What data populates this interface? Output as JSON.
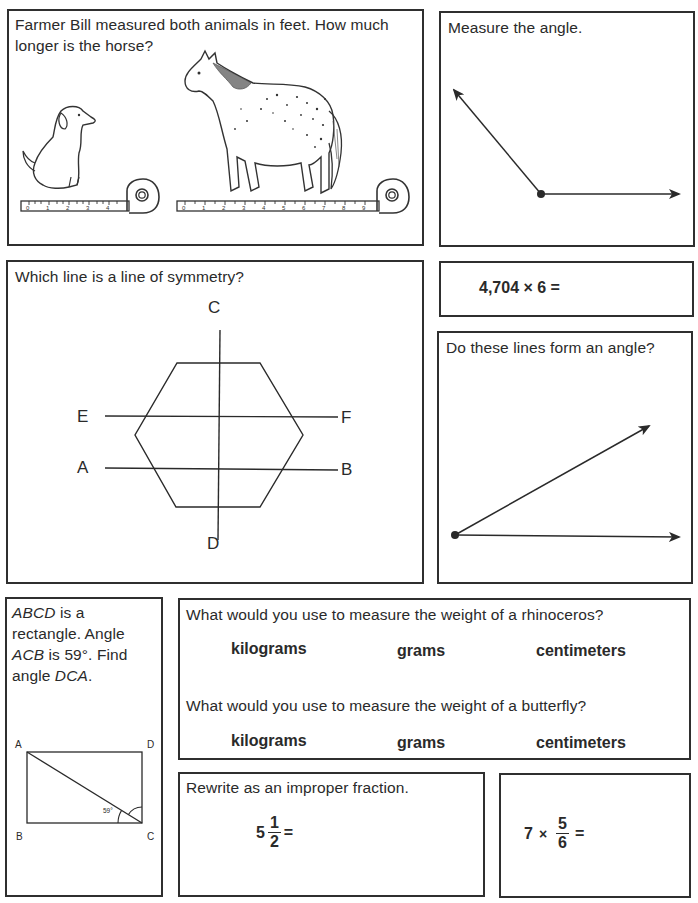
{
  "problems": {
    "horse": {
      "prompt": "Farmer Bill measured both animals in feet. How much longer is the horse?",
      "dog_tape_ticks": [
        "0",
        "1",
        "2",
        "3",
        "4"
      ],
      "horse_tape_ticks": [
        "0",
        "1",
        "2",
        "3",
        "4",
        "5",
        "6",
        "7",
        "8",
        "9"
      ]
    },
    "angle": {
      "prompt": "Measure the angle."
    },
    "symmetry": {
      "prompt": "Which line is a line of symmetry?",
      "labels": {
        "c": "C",
        "d": "D",
        "e": "E",
        "f": "F",
        "a": "A",
        "b": "B"
      }
    },
    "multiply": {
      "expression": "4,704 × 6 ="
    },
    "lines_angle": {
      "prompt": "Do these lines form an angle?"
    },
    "rectangle": {
      "prompt_parts": [
        "ABCD",
        " is a rectangle. Angle ",
        "ACB",
        " is 59°. Find angle ",
        "DCA",
        "."
      ],
      "labels": {
        "a": "A",
        "b": "B",
        "c": "C",
        "d": "D"
      },
      "angle_label": "59°"
    },
    "weight": {
      "q1": "What would you use to measure the weight of a rhinoceros?",
      "q2": "What would you use to measure the weight of a butterfly?",
      "options": [
        "kilograms",
        "grams",
        "centimeters"
      ]
    },
    "improper": {
      "prompt": "Rewrite as an improper fraction.",
      "whole": "5",
      "numerator": "1",
      "denominator": "2",
      "equals": "="
    },
    "fraction_multiply": {
      "whole": "7",
      "times": "×",
      "numerator": "5",
      "denominator": "6",
      "equals": "="
    }
  }
}
